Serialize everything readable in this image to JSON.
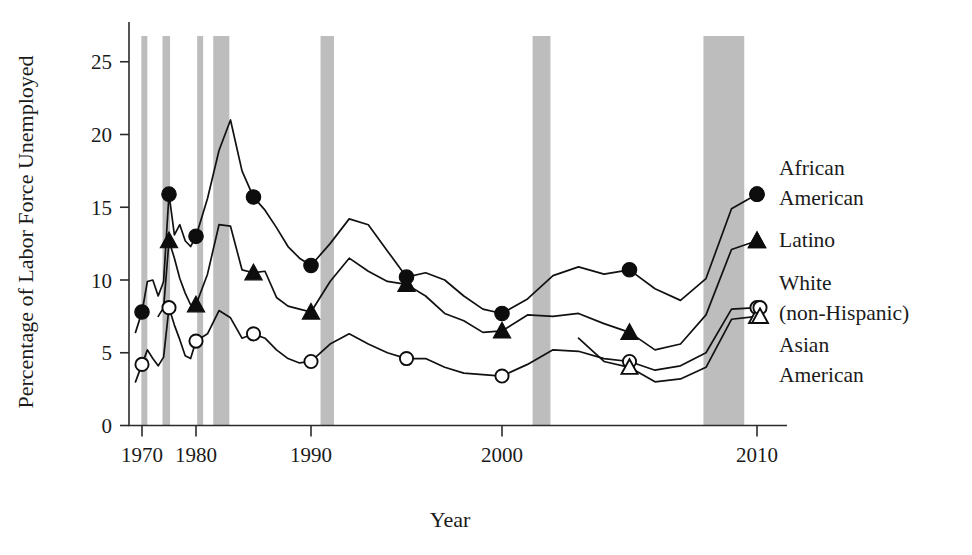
{
  "chart_data": {
    "type": "line",
    "title": "",
    "xlabel": "Year",
    "ylabel": "Percentage of Labor Force Unemployed",
    "xlim": [
      1968,
      2011
    ],
    "ylim": [
      0,
      26
    ],
    "grid": false,
    "legend_position": "right-inline",
    "x_ticks": [
      1970,
      1980,
      1990,
      2000,
      2010
    ],
    "x_tick_labels": [
      "1970",
      "1980",
      "1990",
      "2000",
      "2010"
    ],
    "y_ticks": [
      0,
      5,
      10,
      15,
      20,
      25
    ],
    "y_tick_labels": [
      "0",
      "5",
      "10",
      "15",
      "20",
      "25"
    ],
    "annotations": {
      "shaded_bands_meaning": "recession periods",
      "band_color": "#bdbdbd",
      "recession_bands": [
        {
          "start": 1969.9,
          "end": 1970.9
        },
        {
          "start": 1973.8,
          "end": 1975.2
        },
        {
          "start": 1980.1,
          "end": 1980.6
        },
        {
          "start": 1981.5,
          "end": 1982.9
        },
        {
          "start": 1990.5,
          "end": 1991.2
        },
        {
          "start": 2001.2,
          "end": 2001.9
        },
        {
          "start": 2007.9,
          "end": 2009.5
        }
      ]
    },
    "series": [
      {
        "name": "African American",
        "label_lines": [
          "African",
          "American"
        ],
        "marker": "filled-circle",
        "marker_years": [
          1970,
          1975,
          1980,
          1985,
          1990,
          1995,
          2000,
          2005,
          2010
        ],
        "marker_values": [
          7.8,
          15.9,
          13.0,
          15.7,
          11.0,
          10.2,
          7.7,
          10.7,
          15.9
        ],
        "x": [
          1969,
          1970,
          1971,
          1972,
          1973,
          1974,
          1975,
          1976,
          1977,
          1978,
          1979,
          1980,
          1981,
          1982,
          1983,
          1984,
          1985,
          1986,
          1987,
          1988,
          1989,
          1990,
          1991,
          1992,
          1993,
          1994,
          1995,
          1996,
          1997,
          1998,
          1999,
          2000,
          2001,
          2002,
          2003,
          2004,
          2005,
          2006,
          2007,
          2008,
          2009,
          2010
        ],
        "y": [
          6.4,
          7.8,
          9.9,
          10.0,
          8.9,
          9.9,
          15.9,
          13.1,
          13.8,
          12.7,
          12.3,
          13.0,
          15.6,
          18.9,
          21.0,
          17.5,
          15.7,
          14.8,
          13.6,
          12.3,
          11.5,
          11.0,
          12.5,
          14.2,
          13.8,
          12.0,
          10.2,
          10.5,
          10.0,
          8.9,
          8.0,
          7.7,
          8.7,
          10.3,
          10.9,
          10.4,
          10.7,
          9.4,
          8.6,
          10.1,
          14.9,
          15.9
        ]
      },
      {
        "name": "Latino",
        "label_lines": [
          "Latino"
        ],
        "marker": "filled-triangle",
        "marker_years": [
          1975,
          1980,
          1985,
          1990,
          1995,
          2000,
          2005,
          2010
        ],
        "marker_values": [
          12.7,
          8.3,
          10.5,
          7.8,
          9.7,
          6.5,
          6.4,
          12.7
        ],
        "x": [
          1973,
          1974,
          1975,
          1976,
          1977,
          1978,
          1979,
          1980,
          1981,
          1982,
          1983,
          1984,
          1985,
          1986,
          1987,
          1988,
          1989,
          1990,
          1991,
          1992,
          1993,
          1994,
          1995,
          1996,
          1997,
          1998,
          1999,
          2000,
          2001,
          2002,
          2003,
          2004,
          2005,
          2006,
          2007,
          2008,
          2009,
          2010
        ],
        "y": [
          7.5,
          8.1,
          12.7,
          11.5,
          10.1,
          9.1,
          8.3,
          8.3,
          10.4,
          13.8,
          13.7,
          10.7,
          10.5,
          10.6,
          8.8,
          8.2,
          8.0,
          7.8,
          9.9,
          11.5,
          10.6,
          9.9,
          9.7,
          8.9,
          7.7,
          7.2,
          6.4,
          6.5,
          7.6,
          7.5,
          7.7,
          7.0,
          6.4,
          5.2,
          5.6,
          7.6,
          12.1,
          12.7
        ]
      },
      {
        "name": "White (non-Hispanic)",
        "label_lines": [
          "White",
          "(non-Hispanic)"
        ],
        "marker": "open-circle",
        "marker_years": [
          1970,
          1975,
          1980,
          1985,
          1990,
          1995,
          2000,
          2005,
          2010
        ],
        "marker_values": [
          4.2,
          8.1,
          5.8,
          6.3,
          4.4,
          4.6,
          3.4,
          4.4,
          8.1
        ],
        "x": [
          1969,
          1970,
          1971,
          1972,
          1973,
          1974,
          1975,
          1976,
          1977,
          1978,
          1979,
          1980,
          1981,
          1982,
          1983,
          1984,
          1985,
          1986,
          1987,
          1988,
          1989,
          1990,
          1991,
          1992,
          1993,
          1994,
          1995,
          1996,
          1997,
          1998,
          1999,
          2000,
          2001,
          2002,
          2003,
          2004,
          2005,
          2006,
          2007,
          2008,
          2009,
          2010
        ],
        "y": [
          3.0,
          4.2,
          5.2,
          4.6,
          4.1,
          4.7,
          8.1,
          6.9,
          5.9,
          4.8,
          4.6,
          5.8,
          6.3,
          7.9,
          7.4,
          6.0,
          6.3,
          6.0,
          5.2,
          4.6,
          4.3,
          4.4,
          5.6,
          6.3,
          5.6,
          5.0,
          4.6,
          4.6,
          4.0,
          3.6,
          3.5,
          3.4,
          4.2,
          5.2,
          5.1,
          4.6,
          4.4,
          3.8,
          4.1,
          5.0,
          8.0,
          8.1
        ]
      },
      {
        "name": "Asian American",
        "label_lines": [
          "Asian",
          "American"
        ],
        "marker": "open-triangle",
        "marker_years": [
          2005,
          2010
        ],
        "marker_values": [
          4.0,
          7.5
        ],
        "x": [
          2003,
          2004,
          2005,
          2006,
          2007,
          2008,
          2009,
          2010
        ],
        "y": [
          6.0,
          4.4,
          4.0,
          3.0,
          3.2,
          4.0,
          7.3,
          7.5
        ]
      }
    ]
  }
}
